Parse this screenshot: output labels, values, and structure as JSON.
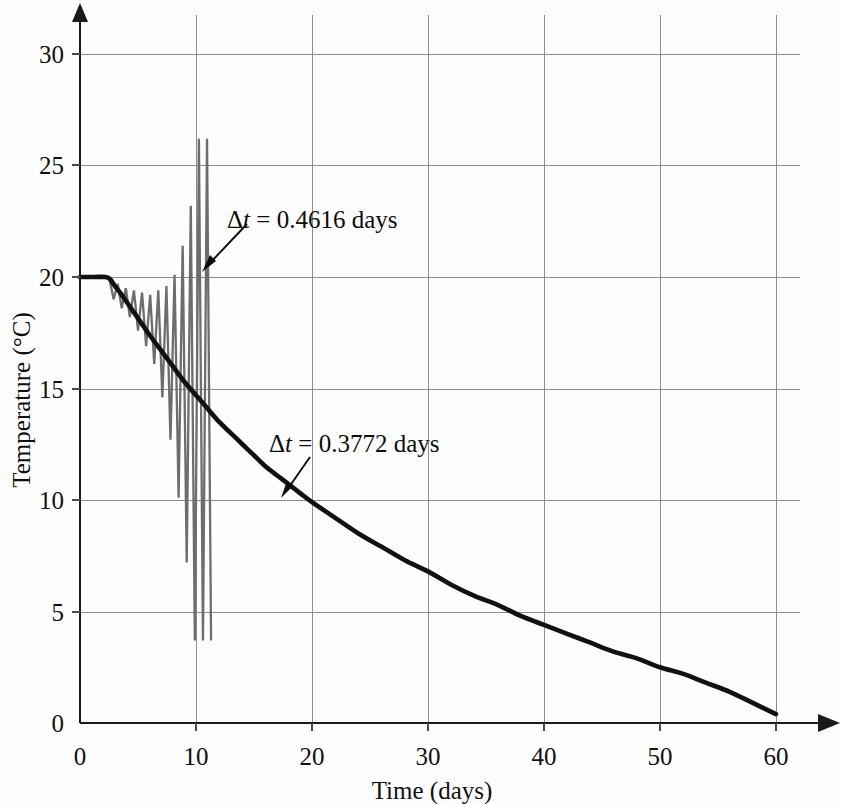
{
  "chart_data": {
    "type": "line",
    "title": "",
    "xlabel": "Time (days)",
    "ylabel": "Temperature (°C)",
    "xlim": [
      0,
      63
    ],
    "ylim": [
      0,
      32
    ],
    "xticks": [
      0,
      10,
      20,
      30,
      40,
      50,
      60
    ],
    "xticklabels": [
      "0",
      "10",
      "20",
      "30",
      "40",
      "50",
      "60"
    ],
    "yticks": [
      0,
      5,
      10,
      15,
      20,
      25,
      30
    ],
    "yticklabels": [
      "0",
      "5",
      "10",
      "15",
      "20",
      "25",
      "30"
    ],
    "grid": true,
    "legend_position": "none",
    "series": [
      {
        "name": "Stable solution, Δt = 0.3772 days",
        "color": "#111111",
        "linewidth": 4.6,
        "x": [
          0,
          1.2,
          2.2,
          2.6,
          3.0,
          3.6,
          4.4,
          5.2,
          6.0,
          7.0,
          8.0,
          9.0,
          10.0,
          11.0,
          12.0,
          13.0,
          14.0,
          15.0,
          16.0,
          17.0,
          18.0,
          19.0,
          20.0,
          22.0,
          24.0,
          26.0,
          28.0,
          30.0,
          32.0,
          34.0,
          36.0,
          38.0,
          40.0,
          42.0,
          44.0,
          46.0,
          48.0,
          50.0,
          52.0,
          54.0,
          56.0,
          58.0,
          60.0
        ],
        "y": [
          20.0,
          20.0,
          20.0,
          19.9,
          19.6,
          19.2,
          18.6,
          18.0,
          17.4,
          16.7,
          16.0,
          15.3,
          14.7,
          14.1,
          13.5,
          13.0,
          12.5,
          12.0,
          11.5,
          11.1,
          10.7,
          10.3,
          9.9,
          9.2,
          8.5,
          7.9,
          7.3,
          6.8,
          6.2,
          5.7,
          5.3,
          4.8,
          4.4,
          4.0,
          3.6,
          3.2,
          2.9,
          2.5,
          2.2,
          1.8,
          1.4,
          0.9,
          0.4
        ]
      },
      {
        "name": "Unstable solution, Δt = 0.4616 days",
        "color": "#6d6d6d",
        "linewidth": 2.3,
        "x": [
          0,
          1.4,
          2.5,
          2.9,
          3.25,
          3.6,
          3.95,
          4.3,
          4.65,
          5.0,
          5.35,
          5.7,
          6.05,
          6.4,
          6.75,
          7.1,
          7.45,
          7.8,
          8.15,
          8.5,
          8.85,
          9.2,
          9.55,
          9.9,
          10.25,
          10.6,
          10.95,
          11.3
        ],
        "y": [
          20.0,
          20.0,
          20.0,
          19.0,
          19.7,
          18.6,
          19.5,
          18.2,
          19.4,
          17.6,
          19.3,
          16.9,
          19.2,
          16.1,
          19.4,
          14.6,
          19.6,
          12.7,
          20.1,
          10.1,
          21.4,
          7.2,
          23.2,
          3.7,
          26.2,
          3.7,
          26.2,
          3.7
        ]
      }
    ],
    "annotations": [
      {
        "id": "unstable-annotation",
        "text_prefix": "Δ",
        "text_italic": "t",
        "text_suffix": " = 0.4616 days",
        "full_text": "Δt = 0.4616 days",
        "label_x": 227,
        "label_y": 205,
        "leader_from": [
          222,
          232
        ],
        "leader_to": [
          199,
          266
        ]
      },
      {
        "id": "stable-annotation",
        "text_prefix": "Δ",
        "text_italic": "t",
        "text_suffix": " = 0.3772 days",
        "full_text": "Δt = 0.3772 days",
        "label_x": 269,
        "label_y": 449,
        "leader_from": [
          311,
          462
        ],
        "leader_to": [
          286,
          495
        ]
      }
    ]
  },
  "colors": {
    "stable_curve": "#111111",
    "unstable_curve": "#6d6d6d",
    "grid": "#8d8d8d",
    "axis": "#1a1a1a",
    "background": "#fdfdfd",
    "text": "#101010"
  }
}
